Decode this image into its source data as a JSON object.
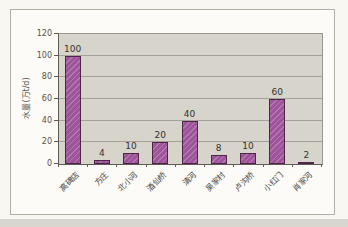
{
  "page": {
    "background": "#f8f7f2",
    "chart_box_background": "#fcfbf7",
    "chart_box_border": "#b3afa7"
  },
  "chart_data": {
    "type": "bar",
    "title": "",
    "categories": [
      "高碑店",
      "方庄",
      "北小河",
      "酒仙桥",
      "清河",
      "吴家村",
      "卢沟桥",
      "小红门",
      "肖家河"
    ],
    "values": [
      100,
      4,
      10,
      20,
      40,
      8,
      10,
      60,
      2
    ],
    "data_labels": [
      "100",
      "4",
      "10",
      "20",
      "40",
      "8",
      "10",
      "60",
      "2"
    ],
    "xlabel": "",
    "ylabel": "水量(万t/d)",
    "ylim": [
      0,
      120
    ],
    "yticks": [
      0,
      20,
      40,
      60,
      80,
      100,
      120
    ],
    "grid": "horizontal",
    "legend": "none",
    "bar_color": "#9e549a",
    "bar_border_color": "#4e2549",
    "plot_background": "#d7d4cc",
    "gridline_color": "#a5a199",
    "axis_color": "#5f5b54"
  }
}
